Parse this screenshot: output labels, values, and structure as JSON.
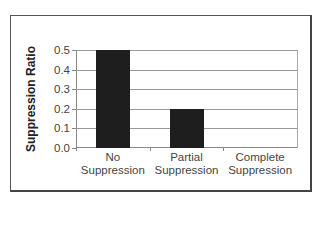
{
  "chart_data": {
    "type": "bar",
    "title": "",
    "xlabel": "",
    "ylabel": "Suppression Ratio",
    "categories": [
      "No Suppression",
      "Partial Suppression",
      "Complete Suppression"
    ],
    "category_lines": [
      [
        "No",
        "Suppression"
      ],
      [
        "Partial",
        "Suppression"
      ],
      [
        "Complete",
        "Suppression"
      ]
    ],
    "values": [
      0.5,
      0.2,
      0.0
    ],
    "ylim": [
      0.0,
      0.5
    ],
    "yticks": [
      "0.0",
      "0.1",
      "0.2",
      "0.3",
      "0.4",
      "0.5"
    ],
    "grid": true,
    "legend": null,
    "bar_color": "#1e1e1e"
  }
}
